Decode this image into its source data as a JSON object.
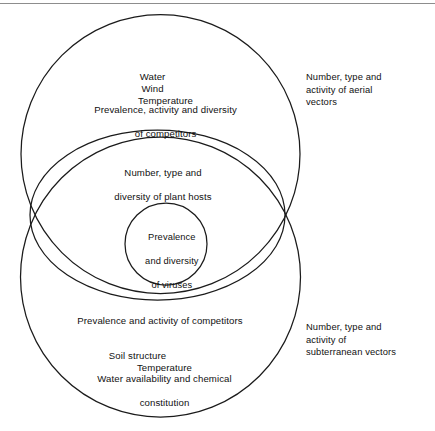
{
  "figure": {
    "kind": "nested-venn-diagram",
    "background_color": "#ffffff",
    "stroke_color": "#1b1b1b",
    "text_color": "#111111",
    "top_rule_color": "#8d8d8d"
  },
  "upper_circle": {
    "name": "aerial-environment-circle",
    "elements_row": {
      "water": "Water",
      "wind": "Wind",
      "temperature": "Temperature"
    },
    "competitors": {
      "line1": "Prevalence, activity and diversity",
      "line2": "of competitors"
    }
  },
  "middle_ellipse": {
    "name": "plant-hosts-ellipse",
    "plant_hosts": {
      "line1": "Number, type and",
      "line2": "diversity of plant hosts"
    }
  },
  "inner_circle": {
    "name": "viruses-circle",
    "viruses": {
      "line1": "Prevalence",
      "line2": "and diversity",
      "line3": "of viruses"
    }
  },
  "lower_circle": {
    "name": "subterranean-environment-circle",
    "competitors": "Prevalence and activity of competitors",
    "soil_row": {
      "soil_structure": "Soil structure",
      "temperature": "Temperature"
    },
    "water_availability": {
      "line1": "Water availability and chemical",
      "line2": "constitution"
    }
  },
  "annotations": {
    "aerial": {
      "line1": "Number, type and",
      "line2": "activity of aerial",
      "line3": "vectors"
    },
    "subterranean": {
      "line1": "Number, type and",
      "line2": "activity of",
      "line3": "subterranean vectors"
    }
  }
}
